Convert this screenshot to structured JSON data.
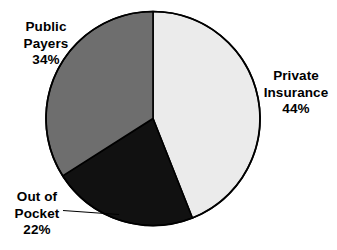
{
  "chart_data": {
    "type": "pie",
    "title": "",
    "subtitle": "",
    "xlabel": "",
    "ylabel": "",
    "legend_position": "none",
    "grid": false,
    "start_angle_deg": 0,
    "direction": "clockwise",
    "categories": [
      "Private Insurance",
      "Out of Pocket",
      "Public Payers"
    ],
    "values": [
      44,
      22,
      34
    ],
    "units": "%",
    "slices": [
      {
        "name": "Private Insurance",
        "label_line1": "Private",
        "label_line2": "Insurance",
        "value": 44,
        "value_label": "44%",
        "color": "#ebebeb",
        "start_angle_deg": 0,
        "end_angle_deg": 158.4
      },
      {
        "name": "Out of Pocket",
        "label_line1": "Out of",
        "label_line2": "Pocket",
        "value": 22,
        "value_label": "22%",
        "color": "#111111",
        "start_angle_deg": 158.4,
        "end_angle_deg": 237.6
      },
      {
        "name": "Public Payers",
        "label_line1": "Public",
        "label_line2": "Payers",
        "value": 34,
        "value_label": "34%",
        "color": "#6e6e6e",
        "start_angle_deg": 237.6,
        "end_angle_deg": 360
      }
    ]
  },
  "colors": {
    "background": "#ffffff",
    "outline": "#000000",
    "private_insurance": "#ebebeb",
    "out_of_pocket": "#111111",
    "public_payers": "#6e6e6e",
    "text": "#000000",
    "leader_line": "#000000"
  },
  "labels": {
    "public_payers": {
      "line1": "Public",
      "line2": "Payers",
      "line3": "34%"
    },
    "private_insurance": {
      "line1": "Private",
      "line2": "Insurance",
      "line3": "44%"
    },
    "out_of_pocket": {
      "line1": "Out of",
      "line2": "Pocket",
      "line3": "22%"
    }
  }
}
